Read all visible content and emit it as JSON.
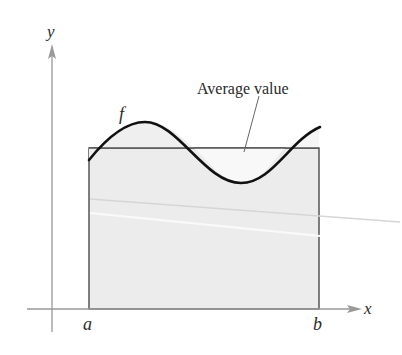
{
  "figure": {
    "type": "average-value-of-function diagram",
    "axes": {
      "x_label": "x",
      "y_label": "y"
    },
    "interval": {
      "left_label": "a",
      "right_label": "b"
    },
    "function_label": "f",
    "annotation": "Average value",
    "colors": {
      "axis": "#9a9a9a",
      "curve": "#111111",
      "rectangle_fill": "#ececec",
      "rectangle_stroke": "#555555",
      "text": "#2a2a2a"
    }
  }
}
